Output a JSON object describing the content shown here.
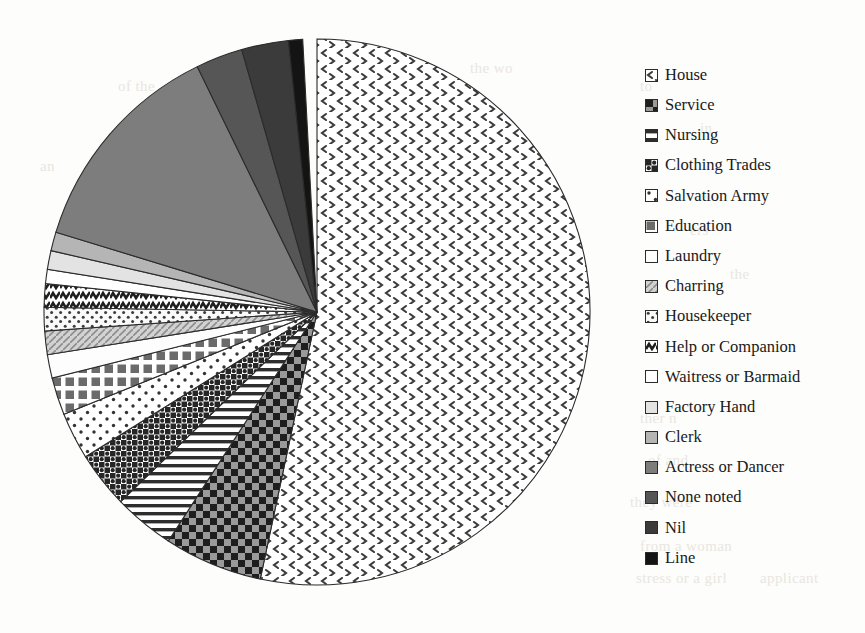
{
  "chart_data": {
    "type": "pie",
    "title": "",
    "legend_position": "right",
    "start_angle_deg": 0,
    "direction": "clockwise",
    "categories": [
      "House",
      "Service",
      "Nursing",
      "Clothing Trades",
      "Salvation Army",
      "Education",
      "Laundry",
      "Charring",
      "Housekeeper",
      "Help or Companion",
      "Waitress or Barmaid",
      "Factory Hand",
      "Clerk",
      "Actress or Dancer",
      "None noted",
      "Nil",
      "Line"
    ],
    "values": [
      192,
      21,
      13,
      12,
      10,
      8,
      5,
      5,
      5,
      5,
      3,
      4,
      4,
      47,
      10,
      10,
      3
    ],
    "value_unit": "degrees",
    "percentages": [
      53.3,
      5.8,
      3.6,
      3.3,
      2.8,
      2.2,
      1.4,
      1.4,
      1.4,
      1.4,
      0.8,
      1.1,
      1.1,
      13.1,
      2.8,
      2.8,
      0.8
    ],
    "xlabel": "",
    "ylabel": "",
    "grid": false
  },
  "legend": {
    "items": [
      {
        "label": "House",
        "pattern": "chevrons",
        "swatch_fill": "#ffffff"
      },
      {
        "label": "Service",
        "pattern": "checker-large",
        "swatch_fill": "#6e6e6e"
      },
      {
        "label": "Nursing",
        "pattern": "h-stripes",
        "swatch_fill": "#d8d8d8"
      },
      {
        "label": "Clothing Trades",
        "pattern": "checker-dots",
        "swatch_fill": "#4a4a4a"
      },
      {
        "label": "Salvation Army",
        "pattern": "sparse-dots",
        "swatch_fill": "#ffffff"
      },
      {
        "label": "Education",
        "pattern": "blocks",
        "swatch_fill": "#707070"
      },
      {
        "label": "Laundry",
        "pattern": "solid-white",
        "swatch_fill": "#ffffff"
      },
      {
        "label": "Charring",
        "pattern": "diagonal-light",
        "swatch_fill": "#c9c9c9"
      },
      {
        "label": "Housekeeper",
        "pattern": "dots-white",
        "swatch_fill": "#f2f2f2"
      },
      {
        "label": "Help or Companion",
        "pattern": "zigzag",
        "swatch_fill": "#3a3a3a"
      },
      {
        "label": "Waitress or Barmaid",
        "pattern": "solid-white",
        "swatch_fill": "#ffffff"
      },
      {
        "label": "Factory Hand",
        "pattern": "light-gray",
        "swatch_fill": "#e0e0e0"
      },
      {
        "label": "Clerk",
        "pattern": "mid-gray",
        "swatch_fill": "#bdbdbd"
      },
      {
        "label": "Actress or Dancer",
        "pattern": "gray",
        "swatch_fill": "#8a8a8a"
      },
      {
        "label": "None noted",
        "pattern": "dark-gray",
        "swatch_fill": "#5c5c5c"
      },
      {
        "label": "Nil",
        "pattern": "darker-gray",
        "swatch_fill": "#3f3f3f"
      },
      {
        "label": "Line",
        "pattern": "near-black",
        "swatch_fill": "#1c1c1c"
      }
    ]
  },
  "pie": {
    "center_x": 317,
    "center_y": 312,
    "radius": 273,
    "outline_color": "#2b2b2b"
  },
  "background_bleed": [
    {
      "text": "of the",
      "x": 118,
      "y": 78
    },
    {
      "text": "to",
      "x": 640,
      "y": 78
    },
    {
      "text": "in",
      "x": 700,
      "y": 120
    },
    {
      "text": "the wo",
      "x": 470,
      "y": 60
    },
    {
      "text": "an",
      "x": 40,
      "y": 158
    },
    {
      "text": "so",
      "x": 58,
      "y": 250
    },
    {
      "text": "ther n",
      "x": 640,
      "y": 410
    },
    {
      "text": "of and",
      "x": 648,
      "y": 452
    },
    {
      "text": "they were",
      "x": 630,
      "y": 494
    },
    {
      "text": "from a woman",
      "x": 640,
      "y": 538
    },
    {
      "text": "stress or a girl",
      "x": 636,
      "y": 570
    },
    {
      "text": "applicant",
      "x": 760,
      "y": 570
    },
    {
      "text": "ers",
      "x": 690,
      "y": 222
    },
    {
      "text": "the",
      "x": 730,
      "y": 266
    }
  ]
}
